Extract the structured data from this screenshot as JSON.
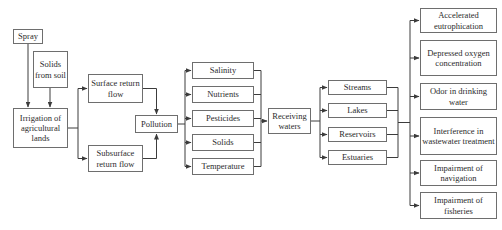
{
  "diagram": {
    "type": "flowchart",
    "background_color": "#ffffff",
    "line_color": "#3c3c3c",
    "box_border_color": "#6e6e6e",
    "text_color": "#2b2b2b",
    "nodes": {
      "spray": "Spray",
      "solids_from_soil": "Solids from soil",
      "irrigation": "Irrigation of agricultural lands",
      "surface_return_flow": "Surface return flow",
      "subsurface_return_flow": "Subsurface return flow",
      "pollution": "Pollution",
      "salinity": "Salinity",
      "nutrients": "Nutrients",
      "pesticides": "Pesticides",
      "solids": "Solids",
      "temperature": "Temperature",
      "receiving_waters": "Receiving waters",
      "streams": "Streams",
      "lakes": "Lakes",
      "reservoirs": "Reservoirs",
      "estuaries": "Estuaries",
      "accelerated_eutrophication": "Accelerated eutrophication",
      "depressed_oxygen": "Depressed oxygen concentration",
      "odor_drinking_water": "Odor in drinking water",
      "interference_wastewater": "Interference in wastewater treatment",
      "impairment_navigation": "Impairment of navigation",
      "impairment_fisheries": "Impairment of fisheries"
    },
    "edges": [
      "spray -> irrigation",
      "solids_from_soil -> irrigation",
      "irrigation -> surface_return_flow",
      "irrigation -> subsurface_return_flow",
      "surface_return_flow -> pollution",
      "subsurface_return_flow -> pollution",
      "pollution -> salinity",
      "pollution -> nutrients",
      "pollution -> pesticides",
      "pollution -> solids",
      "pollution -> temperature",
      "salinity -> receiving_waters",
      "nutrients -> receiving_waters",
      "pesticides -> receiving_waters",
      "solids -> receiving_waters",
      "temperature -> receiving_waters",
      "receiving_waters -> streams",
      "receiving_waters -> lakes",
      "receiving_waters -> reservoirs",
      "receiving_waters -> estuaries",
      "streams -> effects",
      "lakes -> effects",
      "reservoirs -> effects",
      "estuaries -> effects",
      "effects -> accelerated_eutrophication",
      "effects -> depressed_oxygen",
      "effects -> odor_drinking_water",
      "effects -> interference_wastewater",
      "effects -> impairment_navigation",
      "effects -> impairment_fisheries"
    ]
  }
}
